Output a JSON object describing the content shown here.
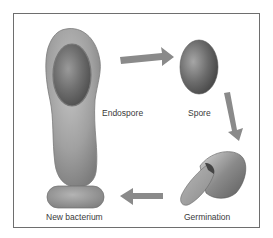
{
  "diagram": {
    "type": "cycle",
    "stages": [
      {
        "id": "endospore",
        "label": "Endospore"
      },
      {
        "id": "spore",
        "label": "Spore"
      },
      {
        "id": "germination",
        "label": "Germination"
      },
      {
        "id": "new-bacterium",
        "label": "New bacterium"
      }
    ],
    "arrows": [
      {
        "from": "endospore",
        "to": "spore"
      },
      {
        "from": "spore",
        "to": "germination"
      },
      {
        "from": "germination",
        "to": "new-bacterium"
      }
    ],
    "colors": {
      "frame": "#6e6e6e",
      "arrow": "#8a8a8a",
      "cell_outer": "#a3a3a3",
      "cell_inner": "#6a6a6a",
      "text": "#3a3a3a"
    }
  }
}
